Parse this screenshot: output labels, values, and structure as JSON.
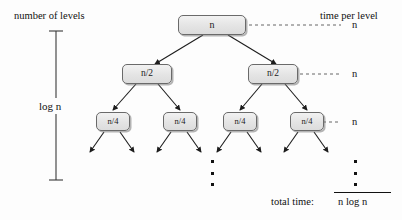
{
  "diagram": {
    "title_left": "number of levels",
    "title_right": "time per level",
    "depth_label": "log n",
    "total_label": "total time:",
    "total_value": "n log n",
    "nodes": {
      "root": "n",
      "level2_left": "n/2",
      "level2_right": "n/2",
      "level3_a": "n/4",
      "level3_b": "n/4",
      "level3_c": "n/4",
      "level3_d": "n/4"
    },
    "per_level_times": {
      "level1": "n",
      "level2": "n",
      "level3": "n"
    },
    "colors": {
      "node_fill": "#e4e4e4",
      "node_stroke": "#6a6a6a",
      "ink": "#111111",
      "background": "#fdfdfd"
    }
  }
}
